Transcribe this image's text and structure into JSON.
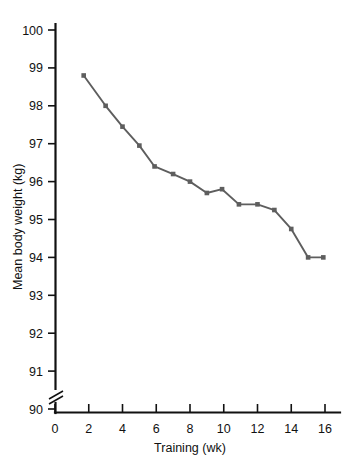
{
  "chart_data": {
    "type": "line",
    "title": "",
    "xlabel": "Training (wk)",
    "ylabel": "Mean body weight (kg)",
    "xlim": [
      0,
      17
    ],
    "ylim": [
      89.6,
      100.3
    ],
    "xticks": [
      0,
      2,
      4,
      6,
      8,
      10,
      12,
      14,
      16
    ],
    "xtick_labels": [
      "0",
      "2",
      "4",
      "6",
      "8",
      "10",
      "12",
      "14",
      "16"
    ],
    "yticks": [
      90,
      91,
      92,
      93,
      94,
      95,
      96,
      97,
      98,
      99,
      100
    ],
    "ytick_labels": [
      "90",
      "91",
      "92",
      "93",
      "94",
      "95",
      "96",
      "97",
      "98",
      "99",
      "100"
    ],
    "y_axis_break": true,
    "y_axis_break_below": 90,
    "grid": false,
    "legend": false,
    "legend_position": "none",
    "marker": "square",
    "series": [
      {
        "name": "Mean body weight",
        "color": "#5e5e5e",
        "x": [
          1.7,
          3.0,
          4.0,
          5.0,
          5.9,
          7.0,
          8.0,
          9.0,
          9.9,
          10.9,
          12.0,
          13.0,
          14.0,
          15.0,
          15.9
        ],
        "values": [
          98.8,
          98.0,
          97.45,
          96.95,
          96.4,
          96.2,
          96.0,
          95.7,
          95.8,
          95.4,
          95.4,
          95.25,
          94.75,
          94.0,
          94.0
        ]
      }
    ]
  },
  "colors": {
    "line": "#5e5e5e",
    "axis": "#111111",
    "background": "#ffffff"
  }
}
